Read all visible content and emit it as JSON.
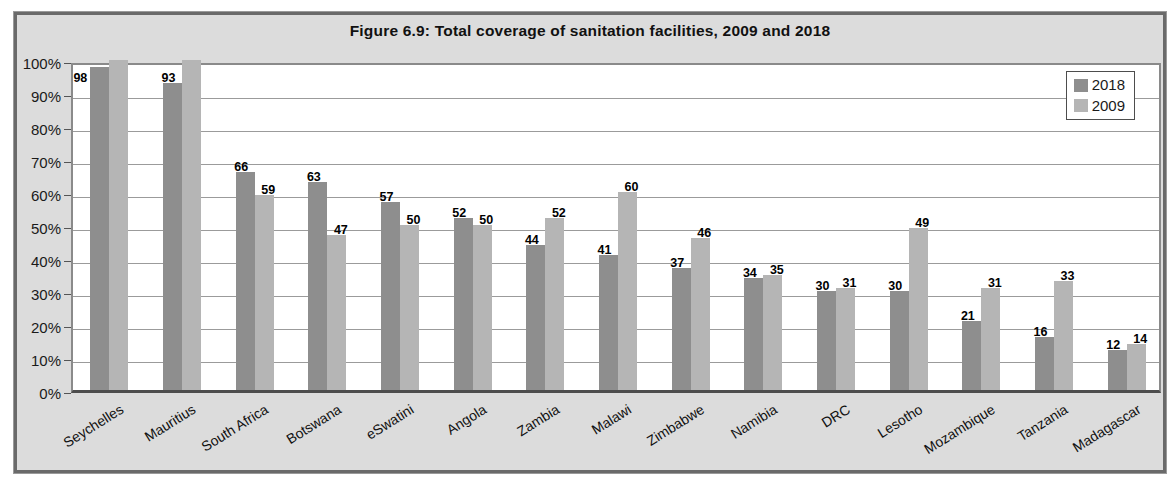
{
  "figure": {
    "title": "Figure 6.9: Total coverage of sanitation facilities, 2009 and 2018"
  },
  "chart_data": {
    "type": "bar",
    "title": "Figure 6.9: Total coverage of sanitation facilities, 2009 and 2018",
    "categories": [
      "Seychelles",
      "Mauritius",
      "South Africa",
      "Botswana",
      "eSwatini",
      "Angola",
      "Zambia",
      "Malawi",
      "Zimbabwe",
      "Namibia",
      "DRC",
      "Lesotho",
      "Mozambique",
      "Tanzania",
      "Madagascar"
    ],
    "series": [
      {
        "name": "2018",
        "color": "#8e8e8e",
        "values": [
          98,
          93,
          66,
          63,
          57,
          52,
          44,
          41,
          37,
          34,
          30,
          30,
          21,
          16,
          12
        ],
        "data_labels": [
          "98",
          "93",
          "66",
          "63",
          "57",
          "52",
          "44",
          "41",
          "37",
          "34",
          "30",
          "30",
          "21",
          "16",
          "12"
        ]
      },
      {
        "name": "2009",
        "color": "#b5b5b5",
        "values": [
          100,
          100,
          59,
          47,
          50,
          50,
          52,
          60,
          46,
          35,
          31,
          49,
          31,
          33,
          14
        ],
        "data_labels": [
          "",
          "",
          "59",
          "47",
          "50",
          "50",
          "52",
          "60",
          "46",
          "35",
          "31",
          "49",
          "31",
          "33",
          "14"
        ]
      }
    ],
    "xlabel": "",
    "ylabel": "",
    "ylim": [
      0,
      100
    ],
    "y_ticks": [
      "0%",
      "10%",
      "20%",
      "30%",
      "40%",
      "50%",
      "60%",
      "70%",
      "80%",
      "90%",
      "100%"
    ],
    "grid": true,
    "legend": {
      "position": "top-right",
      "entries": [
        "2018",
        "2009"
      ]
    }
  },
  "colors": {
    "figure_background": "#dcdcdc",
    "plot_background": "#ffffff",
    "gridline": "#9b9b9b",
    "border": "#6a6a6a",
    "axis_line": "#4d4d4d",
    "series_2018": "#8e8e8e",
    "series_2009": "#b5b5b5"
  }
}
